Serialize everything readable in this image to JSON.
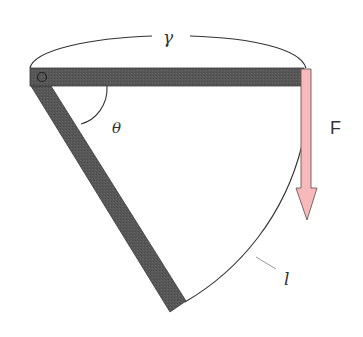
{
  "diagram": {
    "labels": {
      "arc_top": "γ",
      "angle": "θ",
      "force": "F",
      "curve": "l"
    },
    "colors": {
      "bar": "#575757",
      "bar_edge": "#3a3a3a",
      "arrow_fill": "#f7b9ba",
      "arrow_stroke": "#6a5a5a",
      "line": "#333333",
      "leader": "#9a9a9a",
      "background": "#ffffff"
    },
    "elements": [
      {
        "id": "horizontal-bar",
        "description": "horizontal rigid bar with pivot at left end"
      },
      {
        "id": "diagonal-bar",
        "description": "inclined rigid bar from pivot down to lower point"
      },
      {
        "id": "pivot",
        "description": "hinge circle at top-left"
      },
      {
        "id": "force-arrow",
        "description": "downward force arrow at right end of horizontal bar"
      },
      {
        "id": "arc-gamma",
        "description": "arc spanning top bar labeled gamma"
      },
      {
        "id": "angle-theta",
        "description": "angle arc between bars labeled theta"
      },
      {
        "id": "curve-l",
        "description": "curved path from diagonal bar tip up to right end labeled l"
      }
    ]
  }
}
